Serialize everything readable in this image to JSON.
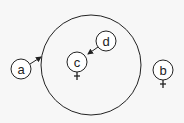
{
  "diagram": {
    "container": {
      "cx": 91,
      "cy": 65,
      "r": 50
    },
    "nodes": [
      {
        "id": "a",
        "label": "a",
        "cx": 21,
        "cy": 69,
        "r": 10,
        "plus": false
      },
      {
        "id": "c",
        "label": "c",
        "cx": 77,
        "cy": 62,
        "r": 10,
        "plus": true
      },
      {
        "id": "d",
        "label": "d",
        "cx": 106,
        "cy": 41,
        "r": 10,
        "plus": false
      },
      {
        "id": "b",
        "label": "b",
        "cx": 163,
        "cy": 72,
        "r": 10,
        "plus": true
      }
    ],
    "arrows": [
      {
        "from": "a",
        "to": "container"
      },
      {
        "from": "d",
        "to": "c"
      }
    ],
    "colors": {
      "stroke": "#222222",
      "background": "#f7f7f7"
    }
  }
}
